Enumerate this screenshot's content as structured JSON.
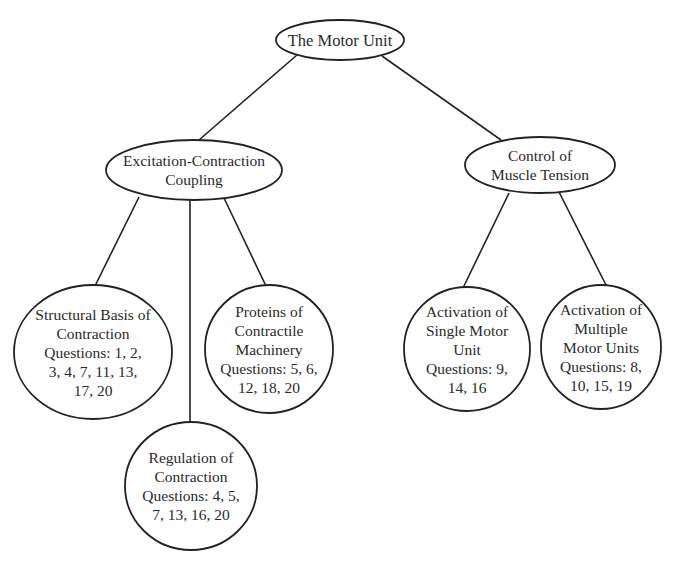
{
  "diagram": {
    "type": "concept-tree",
    "colors": {
      "stroke": "#222222",
      "text": "#2a2a2a",
      "background": "#ffffff"
    },
    "root": {
      "id": "motor-unit",
      "lines": [
        "The Motor Unit"
      ]
    },
    "level1": [
      {
        "id": "excitation-contraction-coupling",
        "lines": [
          "Excitation-Contraction",
          "Coupling"
        ]
      },
      {
        "id": "control-of-muscle-tension",
        "lines": [
          "Control of",
          "Muscle Tension"
        ]
      }
    ],
    "level2": [
      {
        "id": "structural-basis-of-contraction",
        "parent": "excitation-contraction-coupling",
        "lines": [
          "Structural Basis of",
          "Contraction",
          "Questions: 1, 2,",
          "3, 4, 7, 11, 13,",
          "17, 20"
        ],
        "questions": [
          1,
          2,
          3,
          4,
          7,
          11,
          13,
          17,
          20
        ]
      },
      {
        "id": "regulation-of-contraction",
        "parent": "excitation-contraction-coupling",
        "lines": [
          "Regulation of",
          "Contraction",
          "Questions: 4, 5,",
          "7, 13, 16, 20"
        ],
        "questions": [
          4,
          5,
          7,
          13,
          16,
          20
        ]
      },
      {
        "id": "proteins-of-contractile-machinery",
        "parent": "excitation-contraction-coupling",
        "lines": [
          "Proteins of",
          "Contractile",
          "Machinery",
          "Questions: 5, 6,",
          "12, 18, 20"
        ],
        "questions": [
          5,
          6,
          12,
          18,
          20
        ]
      },
      {
        "id": "activation-of-single-motor-unit",
        "parent": "control-of-muscle-tension",
        "lines": [
          "Activation of",
          "Single Motor",
          "Unit",
          "Questions: 9,",
          "14, 16"
        ],
        "questions": [
          9,
          14,
          16
        ]
      },
      {
        "id": "activation-of-multiple-motor-units",
        "parent": "control-of-muscle-tension",
        "lines": [
          "Activation of",
          "Multiple",
          "Motor Units",
          "Questions: 8,",
          "10, 15, 19"
        ],
        "questions": [
          8,
          10,
          15,
          19
        ]
      }
    ],
    "edges": [
      {
        "from": "motor-unit",
        "to": "excitation-contraction-coupling"
      },
      {
        "from": "motor-unit",
        "to": "control-of-muscle-tension"
      },
      {
        "from": "excitation-contraction-coupling",
        "to": "structural-basis-of-contraction"
      },
      {
        "from": "excitation-contraction-coupling",
        "to": "regulation-of-contraction"
      },
      {
        "from": "excitation-contraction-coupling",
        "to": "proteins-of-contractile-machinery"
      },
      {
        "from": "control-of-muscle-tension",
        "to": "activation-of-single-motor-unit"
      },
      {
        "from": "control-of-muscle-tension",
        "to": "activation-of-multiple-motor-units"
      }
    ]
  }
}
